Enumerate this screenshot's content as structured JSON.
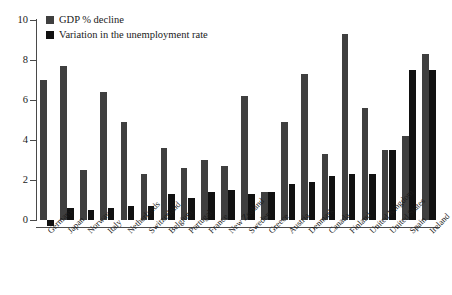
{
  "chart_data": {
    "type": "bar",
    "title": "",
    "xlabel": "",
    "ylabel": "",
    "ylim": [
      -0.5,
      10
    ],
    "yticks": [
      0,
      2,
      4,
      6,
      8,
      10
    ],
    "grid": false,
    "legend_position": "top-left",
    "categories": [
      "Germany",
      "Japan",
      "Norway",
      "Italy",
      "Netherlands",
      "Switzerland",
      "Belgium",
      "Portugal",
      "France",
      "New Zealand",
      "Sweden",
      "Greece",
      "Austria",
      "Denmark",
      "Canada",
      "Finland",
      "United Kingdom",
      "United States",
      "Spain",
      "Ireland"
    ],
    "series": [
      {
        "name": "GDP % decline",
        "color": "#3f3f3f",
        "values": [
          7.0,
          7.7,
          2.5,
          6.4,
          4.9,
          2.3,
          3.6,
          2.6,
          3.0,
          2.7,
          6.2,
          1.4,
          4.9,
          7.3,
          3.3,
          9.3,
          5.6,
          3.5,
          4.2,
          8.3
        ]
      },
      {
        "name": "Variation in the unemployment rate",
        "color": "#111111",
        "values": [
          -0.3,
          0.6,
          0.5,
          0.6,
          0.7,
          0.7,
          1.3,
          1.1,
          1.4,
          1.5,
          1.3,
          1.4,
          1.8,
          1.9,
          2.2,
          2.3,
          2.3,
          3.5,
          7.5,
          7.5
        ]
      }
    ]
  },
  "legend": {
    "items": [
      {
        "label": "GDP % decline",
        "color": "#3f3f3f"
      },
      {
        "label": "Variation in the unemployment rate",
        "color": "#111111"
      }
    ]
  },
  "axis": {
    "y_tick_labels": [
      "10",
      "8",
      "6",
      "4",
      "2",
      "0"
    ]
  }
}
